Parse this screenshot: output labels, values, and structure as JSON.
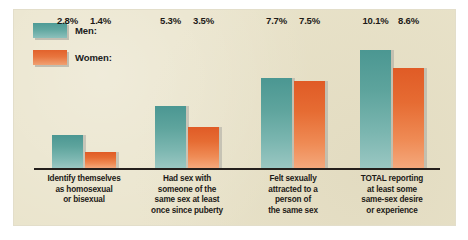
{
  "figure": {
    "panel_background": "#e9e3ca",
    "outer_background": "#ffffff",
    "axis_color": "#241f1c"
  },
  "legend": {
    "items": [
      {
        "label": "Men:",
        "color": "#5ea49d",
        "key": "men"
      },
      {
        "label": "Women:",
        "color": "#e66c33",
        "key": "women"
      }
    ]
  },
  "chart_data": {
    "type": "bar",
    "title": "",
    "subtitle": "",
    "xlabel": "",
    "ylabel": "",
    "ylim": [
      0,
      12
    ],
    "grid": false,
    "legend_position": "top-left",
    "value_suffix": "%",
    "categories": [
      "Identify themselves as homosexual or bisexual",
      "Had sex with someone of the same sex at least once since puberty",
      "Felt sexually attracted to a person of the same sex",
      "TOTAL reporting at least some same-sex desire or experience"
    ],
    "category_lines": [
      [
        "Identify themselves",
        "as homosexual",
        "or bisexual"
      ],
      [
        "Had sex with",
        "someone of the",
        "same sex at least",
        "once since puberty"
      ],
      [
        "Felt sexually",
        "attracted to a",
        "person of",
        "the same sex"
      ],
      [
        "TOTAL  reporting",
        "at least some",
        "same-sex desire",
        "or experience"
      ]
    ],
    "series": [
      {
        "name": "Men:",
        "color": "#5ea49d",
        "values": [
          2.8,
          5.3,
          7.7,
          10.1
        ],
        "labels": [
          "2.8%",
          "5.3%",
          "7.7%",
          "10.1%"
        ]
      },
      {
        "name": "Women:",
        "color": "#e66c33",
        "values": [
          1.4,
          3.5,
          7.5,
          8.6
        ],
        "labels": [
          "1.4%",
          "3.5%",
          "7.5%",
          "8.6%"
        ]
      }
    ]
  }
}
